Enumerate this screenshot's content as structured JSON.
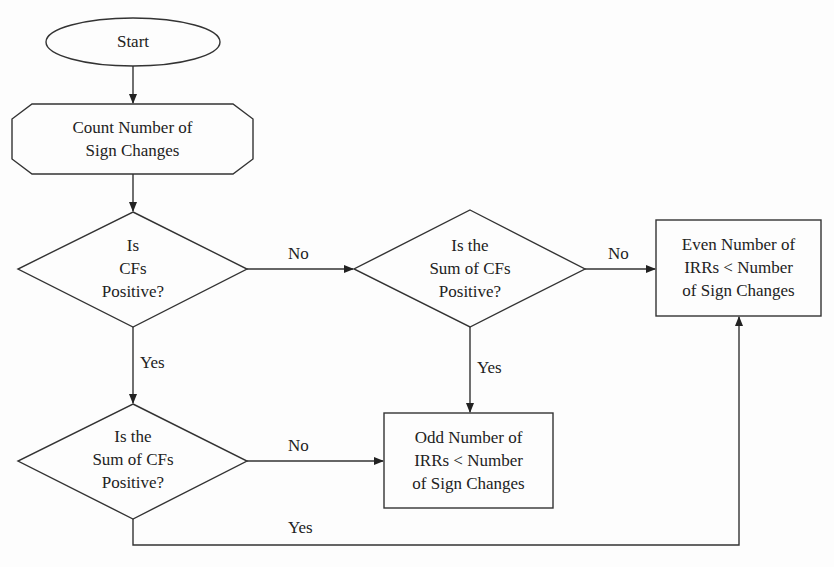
{
  "nodes": {
    "start": {
      "lines": [
        "Start"
      ]
    },
    "count": {
      "lines": [
        "Count Number of",
        "Sign Changes"
      ]
    },
    "decision1": {
      "lines": [
        "Is",
        "CFs",
        "Positive?"
      ]
    },
    "decision2": {
      "lines": [
        "Is the",
        "Sum of CFs",
        "Positive?"
      ]
    },
    "decision3": {
      "lines": [
        "Is the",
        "Sum of CFs",
        "Positive?"
      ]
    },
    "even": {
      "lines": [
        "Even Number of",
        "IRRs < Number",
        "of Sign Changes"
      ]
    },
    "odd": {
      "lines": [
        "Odd Number of",
        "IRRs < Number",
        "of Sign Changes"
      ]
    }
  },
  "edges": {
    "d1_no": "No",
    "d1_yes": "Yes",
    "d2_no": "No",
    "d2_yes": "Yes",
    "d3_no": "No",
    "d3_yes": "Yes"
  },
  "colors": {
    "stroke": "#333333",
    "text": "#222222",
    "background": "#fdfdfd"
  }
}
